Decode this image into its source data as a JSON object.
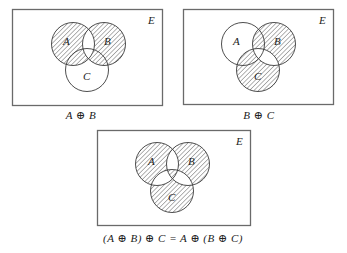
{
  "diagrams": [
    {
      "id": "a-xor-b",
      "universe_label": "E",
      "sets": {
        "A": "A",
        "B": "B",
        "C": "C"
      },
      "caption": "A ⊕ B",
      "hatched_regions": [
        "A only",
        "B only",
        "A∩C only",
        "B∩C only"
      ],
      "unhatched_regions": [
        "A∩B",
        "C only"
      ]
    },
    {
      "id": "b-xor-c",
      "universe_label": "E",
      "sets": {
        "A": "A",
        "B": "B",
        "C": "C"
      },
      "caption": "B ⊕ C",
      "hatched_regions": [
        "B only",
        "C only",
        "A∩B only",
        "A∩C only"
      ],
      "unhatched_regions": [
        "A only",
        "B∩C"
      ]
    },
    {
      "id": "associativity",
      "universe_label": "E",
      "sets": {
        "A": "A",
        "B": "B",
        "C": "C"
      },
      "caption": "(A ⊕ B) ⊕ C = A ⊕ (B ⊕ C)",
      "hatched_regions": [
        "A only",
        "B only",
        "C only",
        "A∩B∩C"
      ],
      "unhatched_regions": [
        "A∩B only",
        "A∩C only",
        "B∩C only"
      ]
    }
  ],
  "colors": {
    "hatch": "#555555",
    "outline": "#3a3a3a",
    "frame": "#6a6a6a",
    "background": "#ffffff"
  }
}
